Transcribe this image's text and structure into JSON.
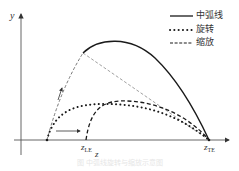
{
  "diagram": {
    "axes": {
      "y_label": "y",
      "x_label": "z"
    },
    "markers": {
      "leading_edge": {
        "symbol": "z",
        "subscript": "LE"
      },
      "trailing_edge": {
        "symbol": "z",
        "subscript": "TE"
      }
    },
    "legend": [
      {
        "style": "solid",
        "label": "中弧线"
      },
      {
        "style": "dotted",
        "label": "旋转"
      },
      {
        "style": "dashed",
        "label": "缩放"
      }
    ],
    "caption": "图 中弧线旋转与缩放示意图",
    "colors": {
      "line": "#1a1a1a",
      "axis": "#555555",
      "thin_dashed": "#777777"
    }
  }
}
